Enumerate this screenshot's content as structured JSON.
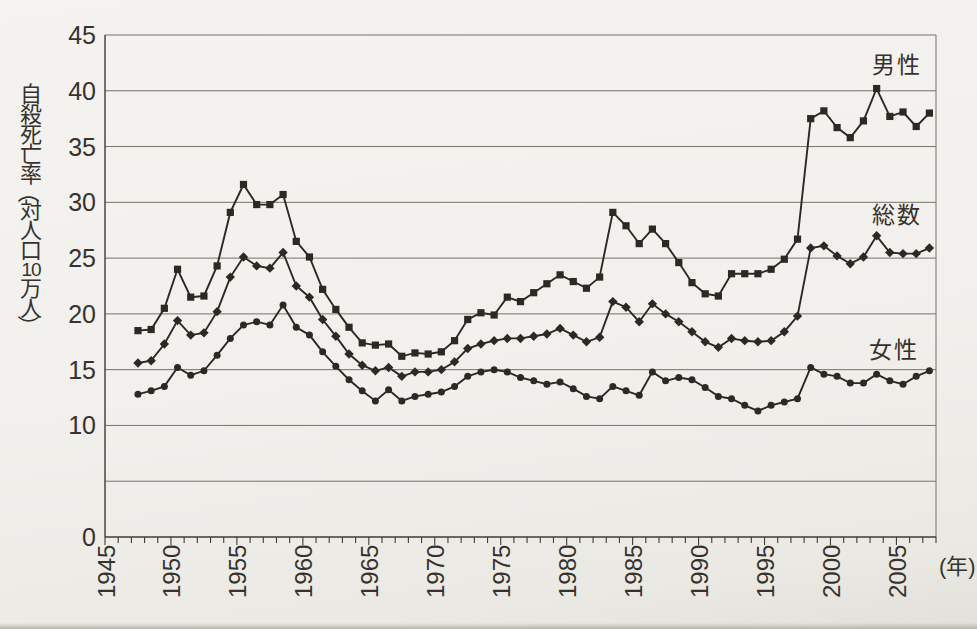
{
  "figure": {
    "y_axis_title": "自殺死亡率（対人口10万人）",
    "y_axis_title_chars": [
      "自",
      "殺",
      "死",
      "亡",
      "率",
      "（",
      "対",
      "人",
      "口",
      "10",
      "万",
      "人",
      "）"
    ],
    "unit_label": "(年)"
  },
  "colors": {
    "paper": "#f1f0ec",
    "line": "#2e2824",
    "grid": "#76726c",
    "axis": "#3f3a35",
    "text": "#37322d"
  },
  "chart_data": {
    "type": "line",
    "title": "",
    "ylabel": "自殺死亡率（対人口10万人）",
    "xlabel": "(年)",
    "xlim": [
      1945,
      2008
    ],
    "ylim": [
      0,
      45
    ],
    "grid": "horizontal",
    "gridline_values": [
      5,
      10,
      15,
      20,
      25,
      30,
      35,
      40,
      45
    ],
    "ytick_labels": [
      0,
      10,
      15,
      20,
      25,
      30,
      35,
      40,
      45
    ],
    "xtick_minor_step": 1,
    "xtick_label_years": [
      1945,
      1950,
      1955,
      1960,
      1965,
      1970,
      1975,
      1980,
      1985,
      1990,
      1995,
      2000,
      2005
    ],
    "legend_position": "inline-right",
    "years": [
      1947,
      1948,
      1949,
      1950,
      1951,
      1952,
      1953,
      1954,
      1955,
      1956,
      1957,
      1958,
      1959,
      1960,
      1961,
      1962,
      1963,
      1964,
      1965,
      1966,
      1967,
      1968,
      1969,
      1970,
      1971,
      1972,
      1973,
      1974,
      1975,
      1976,
      1977,
      1978,
      1979,
      1980,
      1981,
      1982,
      1983,
      1984,
      1985,
      1986,
      1987,
      1988,
      1989,
      1990,
      1991,
      1992,
      1993,
      1994,
      1995,
      1996,
      1997,
      1998,
      1999,
      2000,
      2001,
      2002,
      2003,
      2004,
      2005,
      2006,
      2007
    ],
    "series": [
      {
        "name": "男性",
        "marker": "square",
        "values": [
          18.5,
          18.6,
          20.5,
          24.0,
          21.5,
          21.6,
          24.3,
          29.1,
          31.6,
          29.8,
          29.8,
          30.7,
          26.5,
          25.1,
          22.2,
          20.4,
          18.8,
          17.4,
          17.2,
          17.3,
          16.2,
          16.5,
          16.4,
          16.6,
          17.6,
          19.5,
          20.1,
          19.9,
          21.5,
          21.1,
          21.9,
          22.7,
          23.5,
          22.9,
          22.3,
          23.3,
          29.1,
          27.9,
          26.3,
          27.6,
          26.3,
          24.6,
          22.8,
          21.8,
          21.6,
          23.6,
          23.6,
          23.6,
          24.0,
          24.9,
          26.7,
          37.5,
          38.2,
          36.7,
          35.8,
          37.3,
          40.2,
          37.7,
          38.1,
          36.8,
          38.0
        ]
      },
      {
        "name": "総数",
        "marker": "diamond",
        "values": [
          15.6,
          15.8,
          17.3,
          19.4,
          18.1,
          18.3,
          20.2,
          23.3,
          25.1,
          24.3,
          24.1,
          25.5,
          22.5,
          21.5,
          19.5,
          18.0,
          16.4,
          15.4,
          14.9,
          15.2,
          14.4,
          14.8,
          14.8,
          15.0,
          15.7,
          16.9,
          17.3,
          17.6,
          17.8,
          17.8,
          18.0,
          18.2,
          18.7,
          18.1,
          17.5,
          17.9,
          21.1,
          20.6,
          19.3,
          20.9,
          20.0,
          19.3,
          18.4,
          17.5,
          17.0,
          17.8,
          17.6,
          17.5,
          17.6,
          18.4,
          19.8,
          25.9,
          26.1,
          25.2,
          24.5,
          25.1,
          27.0,
          25.5,
          25.4,
          25.4,
          25.9
        ]
      },
      {
        "name": "女性",
        "marker": "circle",
        "values": [
          12.8,
          13.1,
          13.5,
          15.2,
          14.5,
          14.9,
          16.3,
          17.8,
          19.0,
          19.3,
          19.0,
          20.8,
          18.8,
          18.1,
          16.6,
          15.3,
          14.1,
          13.1,
          12.2,
          13.2,
          12.2,
          12.6,
          12.8,
          13.0,
          13.5,
          14.4,
          14.8,
          15.0,
          14.8,
          14.3,
          14.0,
          13.7,
          13.9,
          13.3,
          12.6,
          12.4,
          13.5,
          13.1,
          12.7,
          14.8,
          14.0,
          14.3,
          14.1,
          13.4,
          12.6,
          12.4,
          11.8,
          11.3,
          11.8,
          12.1,
          12.4,
          15.2,
          14.6,
          14.4,
          13.8,
          13.8,
          14.6,
          14.0,
          13.7,
          14.4,
          14.9
        ]
      }
    ]
  }
}
